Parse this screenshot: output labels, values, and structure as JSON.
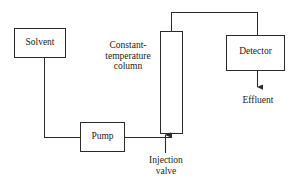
{
  "diagram": {
    "stroke_color": "#2b2b2b",
    "background_color": "#ffffff",
    "boxes": [
      {
        "id": "solvent",
        "label": "Solvent"
      },
      {
        "id": "pump",
        "label": "Pump"
      },
      {
        "id": "column",
        "label": ""
      },
      {
        "id": "detector",
        "label": "Detector"
      }
    ],
    "labels": {
      "solvent": "Solvent",
      "pump": "Pump",
      "detector": "Detector",
      "column_line1": "Constant-",
      "column_line2": "temperature",
      "column_line3": "column",
      "effluent": "Effluent",
      "injection_line1": "Injection",
      "injection_line2": "valve"
    },
    "arrows": [
      {
        "id": "effluent-arrow",
        "direction": "down",
        "label": "Effluent"
      },
      {
        "id": "injection-arrow",
        "direction": "up",
        "label": "Injection valve"
      }
    ]
  }
}
